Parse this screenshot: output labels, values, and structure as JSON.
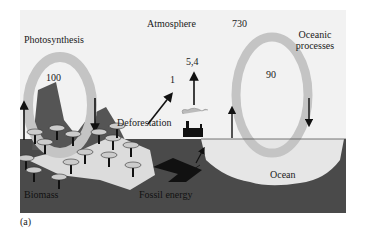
{
  "diagram": {
    "labels": {
      "atmosphere": "Atmosphere",
      "atmosphere_value": "730",
      "photosynthesis": "Photosynthesis",
      "photosynthesis_value": "100",
      "oceanic_processes_line1": "Oceanic",
      "oceanic_processes_line2": "processes",
      "oceanic_value": "90",
      "deforestation": "Deforestation",
      "deforestation_value": "1",
      "fossil_emission_value": "5,4",
      "biomass": "Biomass",
      "fossil_energy": "Fossil energy",
      "ocean": "Ocean"
    },
    "caption": "(a)",
    "colors": {
      "sky": "#f2f2f2",
      "ground": "#4a4a4a",
      "ring": "#c4c4c4",
      "ocean": "#e6e6e6",
      "mountain": "#555555",
      "arrow": "#111111"
    }
  }
}
